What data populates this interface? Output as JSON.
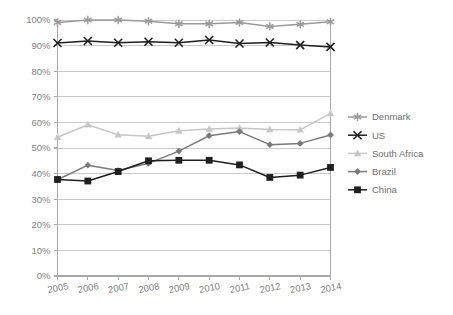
{
  "chart_data": {
    "type": "line",
    "title": "",
    "subtitle": "",
    "xlabel": "",
    "ylabel": "",
    "categories": [
      "2005",
      "2006",
      "2007",
      "2008",
      "2009",
      "2010",
      "2011",
      "2012",
      "2013",
      "2014"
    ],
    "x": [
      2005,
      2006,
      2007,
      2008,
      2009,
      2010,
      2011,
      2012,
      2013,
      2014
    ],
    "ylim": [
      0,
      100
    ],
    "xlim": [
      2005,
      2014
    ],
    "y_tick_labels": [
      "0%",
      "10%",
      "20%",
      "30%",
      "40%",
      "50%",
      "60%",
      "70%",
      "80%",
      "90%",
      "100%"
    ],
    "y_ticks": [
      0,
      10,
      20,
      30,
      40,
      50,
      60,
      70,
      80,
      90,
      100
    ],
    "grid": "horizontal",
    "legend_position": "right",
    "value_suffix": "%",
    "series": [
      {
        "name": "Denmark",
        "color": "#9a9a9a",
        "marker": "asterisk",
        "values": [
          99.0,
          100.0,
          100.0,
          99.5,
          98.5,
          98.5,
          99.0,
          97.5,
          98.3,
          99.3
        ]
      },
      {
        "name": "US",
        "color": "#1f1f1f",
        "marker": "x",
        "values": [
          91.0,
          91.8,
          91.1,
          91.5,
          91.1,
          92.2,
          90.8,
          91.2,
          90.2,
          89.5
        ]
      },
      {
        "name": "South Africa",
        "color": "#c6c6c6",
        "marker": "triangle",
        "values": [
          54.2,
          59.1,
          55.2,
          54.6,
          56.7,
          57.4,
          57.8,
          57.2,
          57.1,
          63.5
        ]
      },
      {
        "name": "Brazil",
        "color": "#7a7a7a",
        "marker": "diamond",
        "values": [
          37.6,
          43.3,
          41.2,
          44.0,
          48.8,
          54.8,
          56.4,
          51.3,
          51.8,
          55.1
        ]
      },
      {
        "name": "China",
        "color": "#1f1f1f",
        "marker": "square",
        "values": [
          37.7,
          37.1,
          40.8,
          45.0,
          45.2,
          45.2,
          43.4,
          38.5,
          39.4,
          42.4
        ]
      }
    ]
  },
  "axes": {
    "frame_color": "#a8a8a8",
    "grid_color": "#c9c9c9",
    "tick_color": "#a8a8a8",
    "label_color": "#808080"
  },
  "legend": {
    "items": [
      {
        "label": "Denmark"
      },
      {
        "label": "US"
      },
      {
        "label": "South Africa"
      },
      {
        "label": "Brazil"
      },
      {
        "label": "China"
      }
    ]
  }
}
